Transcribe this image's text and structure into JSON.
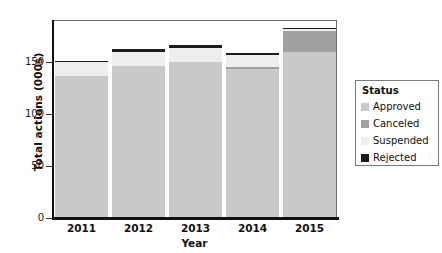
{
  "chart_data": {
    "type": "bar",
    "subtype": "stacked-bar",
    "title": "",
    "xlabel": "Year",
    "ylabel": "Total actions  (000s)",
    "categories": [
      "2011",
      "2012",
      "2013",
      "2014",
      "2015"
    ],
    "ylim": [
      0,
      190
    ],
    "yticks": [
      0,
      50,
      100,
      150
    ],
    "ytick_labels": [
      "0",
      "50",
      "100",
      "150"
    ],
    "grid": false,
    "legend_position": "right",
    "legend_title": "Status",
    "stack_order_bottom_to_top": [
      "Approved",
      "Canceled",
      "Suspended",
      "Rejected"
    ],
    "series": [
      {
        "name": "Approved",
        "color": "#c9c9c9",
        "values": [
          137,
          146,
          150,
          143,
          160
        ]
      },
      {
        "name": "Canceled",
        "color": "#a0a0a0",
        "values": [
          0,
          0,
          0,
          2,
          20
        ]
      },
      {
        "name": "Suspended",
        "color": "#eeeeee",
        "values": [
          13,
          14,
          13,
          12,
          2
        ]
      },
      {
        "name": "Rejected",
        "color": "#1c1c1c",
        "values": [
          1,
          3,
          3,
          2,
          1
        ]
      }
    ],
    "totals": [
      151,
      163,
      166,
      159,
      183
    ]
  },
  "axes": {
    "y_title": "Total actions  (000s)",
    "x_title": "Year",
    "y_tick_labels": [
      "150",
      "100",
      "50",
      "0"
    ],
    "x_tick_labels": [
      "2011",
      "2012",
      "2013",
      "2014",
      "2015"
    ]
  },
  "legend": {
    "title": "Status",
    "items": [
      {
        "label": "Approved",
        "color": "#c9c9c9"
      },
      {
        "label": "Canceled",
        "color": "#a0a0a0"
      },
      {
        "label": "Suspended",
        "color": "#eeeeee"
      },
      {
        "label": "Rejected",
        "color": "#1c1c1c"
      }
    ]
  },
  "colors": {
    "background": "#ffffff",
    "axis": "#111111",
    "frame": "#6f6f6f",
    "text": "#111111"
  }
}
